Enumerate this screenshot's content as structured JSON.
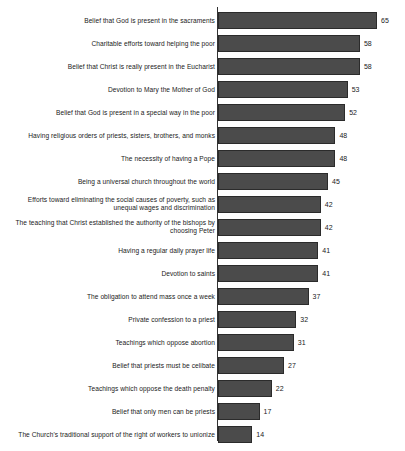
{
  "chart_data": {
    "type": "bar",
    "orientation": "horizontal",
    "title": "",
    "subtitle": "",
    "xlabel": "",
    "ylabel": "",
    "xlim": [
      0,
      65
    ],
    "grid": false,
    "legend": null,
    "bar_color": "#4b4b4b",
    "bar_border_color": "#2b2b2b",
    "axis_color": "#333333",
    "background_color": "#ffffff",
    "value_labels_shown": true,
    "axis_tick_labels_shown": false,
    "categories": [
      "Belief that God is present in the sacraments",
      "Charitable efforts toward helping the poor",
      "Belief that Christ is really present in the Eucharist",
      "Devotion to Mary the Mother of God",
      "Belief that God is present in a special way in the poor",
      "Having religious orders of priests, sisters, brothers, and monks",
      "The necessity of having a Pope",
      "Being a universal church throughout the world",
      "Efforts toward eliminating the social causes of poverty, such as unequal wages and discrimination",
      "The teaching that Christ established the authority of the bishops by choosing Peter",
      "Having a regular daily prayer life",
      "Devotion to saints",
      "The obligation to attend mass once a week",
      "Private confession to a priest",
      "Teachings which oppose abortion",
      "Belief that priests must be celibate",
      "Teachings which oppose the death penalty",
      "Belief that only men can be priests",
      "The Church's traditional support of the right of workers to unionize"
    ],
    "values": [
      65,
      58,
      58,
      53,
      52,
      48,
      48,
      45,
      42,
      42,
      41,
      41,
      37,
      32,
      31,
      27,
      22,
      17,
      14
    ]
  }
}
